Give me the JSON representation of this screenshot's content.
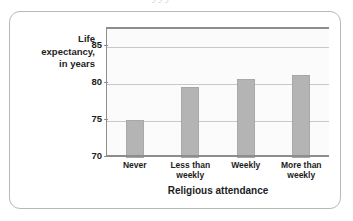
{
  "figure": {
    "clipped_text_above": "yyy",
    "frame_color": "#b8b8b8",
    "axis_color": "#8d8d8d",
    "bar_color": "#b4b4b4",
    "gridline_color": "#c8c8c8",
    "plot_background": "#fbfbfb"
  },
  "chart_data": {
    "type": "bar",
    "title": "",
    "categories": [
      "Never",
      "Less than weekly",
      "Weekly",
      "More than weekly"
    ],
    "category_lines": [
      [
        "Never"
      ],
      [
        "Less than",
        "weekly"
      ],
      [
        "Weekly"
      ],
      [
        "More than",
        "weekly"
      ]
    ],
    "values": [
      75.1,
      79.6,
      80.7,
      81.2
    ],
    "xlabel": "Religious attendance",
    "ylabel": "Life expectancy, in years",
    "ylabel_lines": [
      "Life",
      "expectancy,",
      "in years"
    ],
    "ylim": [
      70,
      87.5
    ],
    "yticks": [
      70,
      75,
      80,
      85
    ],
    "ytick_labels": [
      "70",
      "75",
      "80",
      "85"
    ],
    "grid": true,
    "legend": null
  }
}
